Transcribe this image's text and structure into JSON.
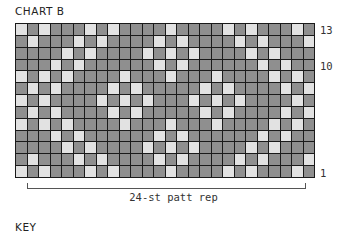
{
  "chart": {
    "title": "CHART B",
    "columns": 26,
    "rows": 13,
    "colors": {
      "dark": "#8f8f8f",
      "light": "#e2e2e2",
      "gridline": "#1a1a1a"
    },
    "row_labels": [
      {
        "row": 13,
        "label": "13"
      },
      {
        "row": 10,
        "label": "10"
      },
      {
        "row": 1,
        "label": "1"
      }
    ],
    "repeat_lines_after_cols": [
      6,
      18
    ],
    "light_cells_by_row": {
      "13": [
        1,
        3,
        7,
        9,
        14,
        19,
        21,
        25
      ],
      "12": [
        2,
        6,
        8,
        13,
        15,
        20,
        22,
        26
      ],
      "11": [
        5,
        7,
        12,
        14,
        16,
        21,
        23
      ],
      "10": [
        4,
        6,
        13,
        15,
        22,
        24
      ],
      "9": [
        1,
        3,
        5,
        10,
        14,
        18,
        23,
        25
      ],
      "8": [
        2,
        4,
        9,
        11,
        17,
        19,
        24,
        26
      ],
      "7": [
        1,
        3,
        8,
        10,
        12,
        16,
        18,
        20,
        25
      ],
      "6": [
        2,
        4,
        9,
        11,
        17,
        19,
        24,
        26
      ],
      "5": [
        1,
        3,
        5,
        10,
        14,
        18,
        23,
        25
      ],
      "4": [
        4,
        6,
        13,
        15,
        22,
        24
      ],
      "3": [
        5,
        7,
        12,
        14,
        16,
        21,
        23
      ],
      "2": [
        2,
        6,
        8,
        13,
        15,
        20,
        22,
        26
      ],
      "1": [
        1,
        3,
        7,
        9,
        14,
        19,
        21,
        25
      ]
    },
    "repeat_bracket": {
      "label": "24-st patt rep",
      "from_col": 2,
      "to_col": 25
    }
  },
  "key": {
    "title": "KEY"
  }
}
